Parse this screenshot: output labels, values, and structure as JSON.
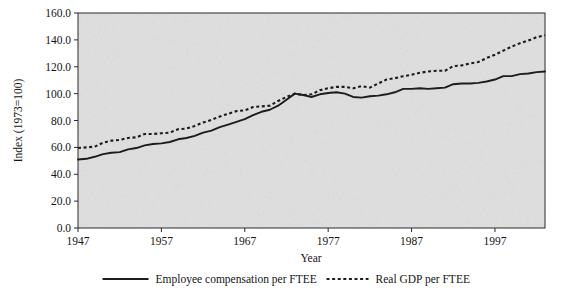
{
  "chart_data": {
    "type": "line",
    "title": "",
    "xlabel": "Year",
    "ylabel": "Index (1973=100)",
    "xlim": [
      1947,
      2003
    ],
    "ylim": [
      0.0,
      160.0
    ],
    "grid": false,
    "legend_position": "bottom",
    "background_color": "#dddddd",
    "line_color": "#1c1c1c",
    "x_tick_labels": [
      "1947",
      "1957",
      "1967",
      "1977",
      "1987",
      "1997"
    ],
    "x_ticks": [
      1947,
      1957,
      1967,
      1977,
      1987,
      1997
    ],
    "y_tick_labels": [
      "0.0",
      "20.0",
      "40.0",
      "60.0",
      "80.0",
      "100.0",
      "120.0",
      "140.0",
      "160.0"
    ],
    "y_ticks": [
      0.0,
      20.0,
      40.0,
      60.0,
      80.0,
      100.0,
      120.0,
      140.0,
      160.0
    ],
    "x": [
      1947,
      1948,
      1949,
      1950,
      1951,
      1952,
      1953,
      1954,
      1955,
      1956,
      1957,
      1958,
      1959,
      1960,
      1961,
      1962,
      1963,
      1964,
      1965,
      1966,
      1967,
      1968,
      1969,
      1970,
      1971,
      1972,
      1973,
      1974,
      1975,
      1976,
      1977,
      1978,
      1979,
      1980,
      1981,
      1982,
      1983,
      1984,
      1985,
      1986,
      1987,
      1988,
      1989,
      1990,
      1991,
      1992,
      1993,
      1994,
      1995,
      1996,
      1997,
      1998,
      1999,
      2000,
      2001,
      2002,
      2003
    ],
    "series": [
      {
        "name": "Employee compensation per FTEE",
        "style": "solid",
        "values": [
          51.0,
          51.5,
          53.0,
          55.0,
          56.0,
          56.5,
          58.5,
          59.5,
          61.5,
          62.5,
          63.0,
          64.0,
          66.0,
          67.0,
          68.5,
          71.0,
          72.5,
          75.0,
          77.0,
          79.0,
          81.0,
          84.0,
          86.5,
          88.0,
          91.0,
          95.5,
          100.0,
          99.0,
          97.5,
          99.5,
          100.5,
          101.0,
          100.0,
          97.5,
          97.0,
          98.0,
          98.5,
          99.5,
          101.0,
          103.5,
          103.5,
          104.0,
          103.5,
          104.0,
          104.5,
          107.0,
          107.5,
          107.5,
          108.0,
          109.0,
          110.5,
          113.0,
          113.0,
          114.5,
          115.0,
          116.0,
          116.5
        ]
      },
      {
        "name": "Real GDP per FTEE",
        "style": "dashed",
        "values": [
          59.5,
          60.0,
          60.5,
          63.5,
          65.0,
          65.5,
          67.0,
          67.5,
          70.0,
          70.0,
          70.5,
          71.0,
          73.5,
          74.0,
          76.0,
          78.5,
          80.5,
          83.0,
          85.0,
          87.0,
          87.5,
          90.0,
          90.5,
          91.0,
          94.5,
          97.5,
          100.0,
          99.0,
          99.5,
          102.5,
          104.0,
          105.0,
          105.0,
          104.0,
          105.5,
          104.5,
          107.5,
          110.5,
          111.5,
          113.0,
          114.0,
          115.5,
          116.5,
          117.0,
          117.0,
          120.5,
          121.0,
          122.5,
          123.5,
          126.5,
          129.0,
          132.0,
          135.0,
          137.5,
          139.5,
          142.0,
          143.5
        ]
      }
    ]
  },
  "legend": {
    "entries": [
      {
        "label": "Employee compensation per FTEE",
        "style": "solid"
      },
      {
        "label": "Real GDP per FTEE",
        "style": "dashed"
      }
    ]
  }
}
